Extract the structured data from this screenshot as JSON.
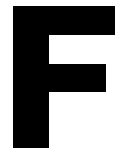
{
  "glyph": {
    "letter": "F",
    "color": "#000000",
    "background": "#ffffff"
  }
}
